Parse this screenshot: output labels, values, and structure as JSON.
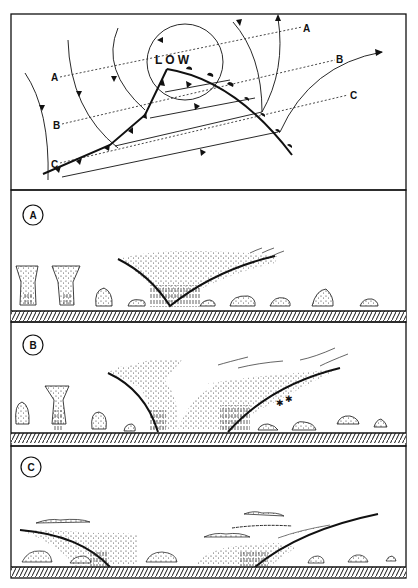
{
  "map": {
    "center_label": "LOW",
    "section_lines": [
      {
        "id": "A",
        "start_label": "A",
        "end_label": "A"
      },
      {
        "id": "B",
        "start_label": "B",
        "end_label": "B"
      },
      {
        "id": "C",
        "start_label": "C",
        "end_label": "C"
      }
    ]
  },
  "panels": [
    {
      "id": "A",
      "badge": "A"
    },
    {
      "id": "B",
      "badge": "B"
    },
    {
      "id": "C",
      "badge": "C"
    }
  ],
  "colors": {
    "ink": "#111111",
    "paper": "#ffffff",
    "stipple": "#444444"
  }
}
